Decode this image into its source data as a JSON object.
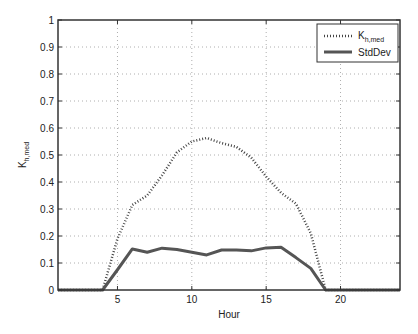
{
  "chart_data": {
    "type": "line",
    "title": "",
    "xlabel": "Hour",
    "ylabel": "K_h,med",
    "ylabel_main": "K",
    "ylabel_sub": "h,med",
    "xlim": [
      1,
      24
    ],
    "ylim": [
      0,
      1
    ],
    "xticks": [
      5,
      10,
      15,
      20
    ],
    "yticks": [
      0,
      0.1,
      0.2,
      0.3,
      0.4,
      0.5,
      0.6,
      0.7,
      0.8,
      0.9,
      1
    ],
    "ytick_labels": [
      "0",
      "0.1",
      "0.2",
      "0.3",
      "0.4",
      "0.5",
      "0.6",
      "0.7",
      "0.8",
      "0.9",
      "1"
    ],
    "xtick_labels": [
      "5",
      "10",
      "15",
      "20"
    ],
    "grid": true,
    "legend_position": "upper right",
    "x": [
      1,
      2,
      3,
      4,
      5,
      6,
      7,
      8,
      9,
      10,
      11,
      12,
      13,
      14,
      15,
      16,
      17,
      18,
      19,
      20,
      21,
      22,
      23,
      24
    ],
    "series": [
      {
        "name": "K_h,med",
        "legend_main": "K",
        "legend_sub": "h,med",
        "style": "dotted",
        "color": "#444444",
        "values": [
          0,
          0,
          0,
          0,
          0.19,
          0.315,
          0.35,
          0.425,
          0.51,
          0.55,
          0.563,
          0.544,
          0.53,
          0.49,
          0.42,
          0.36,
          0.32,
          0.21,
          0,
          0,
          0,
          0,
          0,
          0
        ]
      },
      {
        "name": "StdDev",
        "legend_main": "StdDev",
        "legend_sub": "",
        "style": "solid",
        "color": "#555555",
        "values": [
          0,
          0,
          0,
          0,
          0.075,
          0.152,
          0.14,
          0.155,
          0.15,
          0.14,
          0.13,
          0.148,
          0.148,
          0.145,
          0.156,
          0.158,
          0.12,
          0.08,
          0,
          0,
          0,
          0,
          0,
          0
        ]
      }
    ]
  }
}
